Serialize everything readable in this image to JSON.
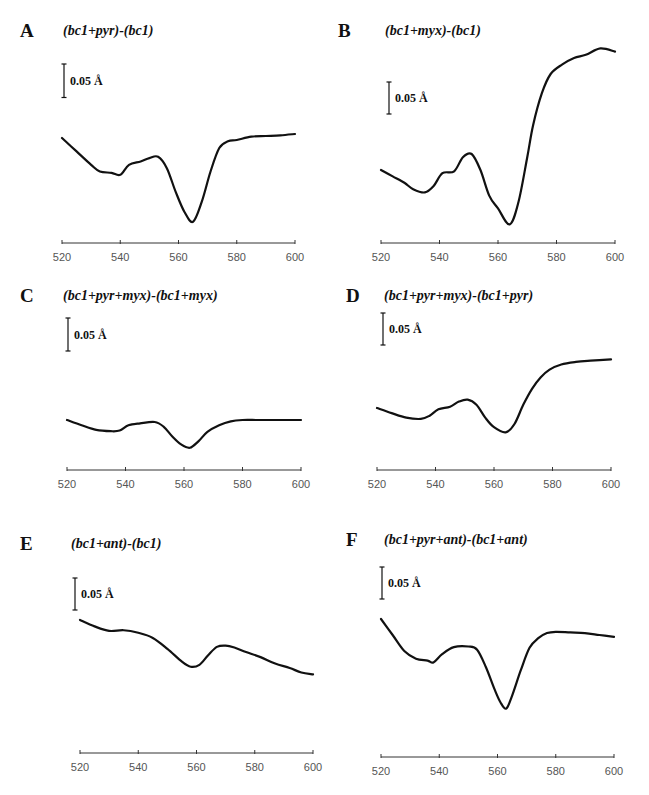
{
  "scale_bar_label": "0.05 Å",
  "chart_data": [
    {
      "id": "A",
      "type": "line",
      "title": "(bc1+pyr)-(bc1)",
      "xlabel": "",
      "ylabel": "ΔA",
      "xlim": [
        520,
        600
      ],
      "x_ticks": [
        520,
        540,
        560,
        580,
        600
      ],
      "scale_bar": 0.05,
      "grid": false,
      "x": [
        520,
        525,
        530,
        533,
        537,
        540,
        543,
        547,
        550,
        553,
        556,
        559,
        562,
        565,
        568,
        571,
        574,
        577,
        580,
        585,
        590,
        595,
        600
      ],
      "y": [
        0.0,
        -0.02,
        -0.04,
        -0.05,
        -0.052,
        -0.055,
        -0.04,
        -0.035,
        -0.03,
        -0.028,
        -0.045,
        -0.08,
        -0.11,
        -0.125,
        -0.095,
        -0.05,
        -0.015,
        -0.005,
        -0.003,
        0.002,
        0.003,
        0.004,
        0.006
      ]
    },
    {
      "id": "B",
      "type": "line",
      "title": "(bc1+myx)-(bc1)",
      "xlabel": "",
      "ylabel": "ΔA",
      "xlim": [
        520,
        600
      ],
      "x_ticks": [
        520,
        540,
        560,
        580,
        600
      ],
      "scale_bar": 0.05,
      "grid": false,
      "x": [
        520,
        524,
        528,
        531,
        535,
        538,
        541,
        545,
        548,
        551,
        554,
        557,
        560,
        564,
        567,
        570,
        572,
        575,
        578,
        582,
        586,
        590,
        595,
        600
      ],
      "y": [
        0.0,
        -0.01,
        -0.02,
        -0.03,
        -0.035,
        -0.025,
        -0.005,
        -0.002,
        0.02,
        0.025,
        0.0,
        -0.04,
        -0.06,
        -0.085,
        -0.05,
        0.02,
        0.07,
        0.12,
        0.15,
        0.165,
        0.175,
        0.18,
        0.19,
        0.185
      ]
    },
    {
      "id": "C",
      "type": "line",
      "title": "(bc1+pyr+myx)-(bc1+myx)",
      "xlabel": "",
      "ylabel": "ΔA",
      "xlim": [
        520,
        600
      ],
      "x_ticks": [
        520,
        540,
        560,
        580,
        600
      ],
      "scale_bar": 0.05,
      "grid": false,
      "x": [
        520,
        525,
        530,
        535,
        538,
        541,
        545,
        550,
        553,
        556,
        559,
        562,
        565,
        568,
        572,
        576,
        580,
        585,
        590,
        595,
        600
      ],
      "y": [
        0.0,
        -0.008,
        -0.015,
        -0.017,
        -0.016,
        -0.008,
        -0.005,
        -0.003,
        -0.01,
        -0.025,
        -0.037,
        -0.042,
        -0.032,
        -0.018,
        -0.008,
        -0.002,
        0.0,
        0.0,
        0.0,
        0.0,
        0.0
      ]
    },
    {
      "id": "D",
      "type": "line",
      "title": "(bc1+pyr+myx)-(bc1+pyr)",
      "xlabel": "",
      "ylabel": "ΔA",
      "xlim": [
        520,
        600
      ],
      "x_ticks": [
        520,
        540,
        560,
        580,
        600
      ],
      "scale_bar": 0.05,
      "grid": false,
      "x": [
        520,
        525,
        530,
        535,
        538,
        541,
        545,
        548,
        551,
        554,
        557,
        560,
        564,
        567,
        570,
        573,
        576,
        579,
        583,
        588,
        593,
        600
      ],
      "y": [
        0.0,
        -0.008,
        -0.015,
        -0.017,
        -0.012,
        -0.002,
        0.002,
        0.01,
        0.013,
        0.005,
        -0.015,
        -0.03,
        -0.038,
        -0.025,
        0.005,
        0.03,
        0.048,
        0.06,
        0.068,
        0.072,
        0.074,
        0.076
      ]
    },
    {
      "id": "E",
      "type": "line",
      "title": "(bc1+ant)-(bc1)",
      "xlabel": "",
      "ylabel": "ΔA",
      "xlim": [
        520,
        600
      ],
      "x_ticks": [
        520,
        540,
        560,
        580,
        600
      ],
      "scale_bar": 0.05,
      "grid": false,
      "x": [
        520,
        525,
        530,
        535,
        540,
        545,
        550,
        555,
        558,
        561,
        564,
        567,
        570,
        573,
        577,
        582,
        587,
        592,
        596,
        600
      ],
      "y": [
        0.0,
        -0.01,
        -0.017,
        -0.016,
        -0.02,
        -0.028,
        -0.045,
        -0.065,
        -0.073,
        -0.07,
        -0.055,
        -0.042,
        -0.04,
        -0.043,
        -0.05,
        -0.058,
        -0.068,
        -0.075,
        -0.082,
        -0.085
      ]
    },
    {
      "id": "F",
      "type": "line",
      "title": "(bc1+pyr+ant)-(bc1+ant)",
      "xlabel": "",
      "ylabel": "ΔA",
      "xlim": [
        520,
        600
      ],
      "x_ticks": [
        520,
        540,
        560,
        580,
        600
      ],
      "scale_bar": 0.05,
      "grid": false,
      "x": [
        520,
        524,
        528,
        532,
        536,
        538,
        541,
        545,
        550,
        553,
        556,
        559,
        561,
        563,
        565,
        568,
        571,
        574,
        577,
        580,
        585,
        590,
        595,
        600
      ],
      "y": [
        0.0,
        -0.025,
        -0.05,
        -0.062,
        -0.065,
        -0.068,
        -0.055,
        -0.044,
        -0.043,
        -0.048,
        -0.075,
        -0.11,
        -0.13,
        -0.14,
        -0.12,
        -0.08,
        -0.045,
        -0.03,
        -0.022,
        -0.02,
        -0.021,
        -0.022,
        -0.025,
        -0.028
      ]
    }
  ]
}
